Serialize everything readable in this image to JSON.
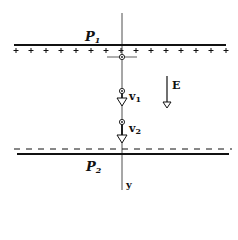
{
  "diagram": {
    "type": "parallel-plate capacitor with charged particle trajectory",
    "labels": {
      "top_plate": "P",
      "top_plate_sub": "1",
      "bottom_plate": "P",
      "bottom_plate_sub": "2",
      "field": "E",
      "velocity1": "v",
      "velocity1_sub": "1",
      "velocity2": "v",
      "velocity2_sub": "2",
      "axis": "y"
    },
    "top_plate_charge": "+",
    "bottom_plate_charge": "-",
    "plus_count": 15,
    "minus_count": 15,
    "colors": {
      "ink": "#111111",
      "background": "#ffffff"
    }
  }
}
